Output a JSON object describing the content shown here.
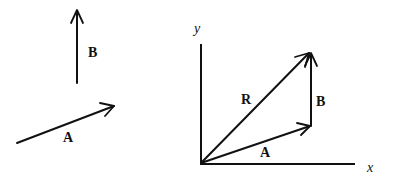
{
  "left_panel": {
    "vectors": [
      {
        "name": "B",
        "label": "B",
        "direction": "up"
      },
      {
        "name": "A",
        "label": "A",
        "direction": "up-right"
      }
    ]
  },
  "right_panel": {
    "axes": {
      "x_label": "x",
      "y_label": "y"
    },
    "vectors": [
      {
        "name": "A",
        "label": "A",
        "from": "origin",
        "to": "tail of B"
      },
      {
        "name": "B",
        "label": "B",
        "from": "head of A",
        "to": "head of R"
      },
      {
        "name": "R",
        "label": "R",
        "from": "origin",
        "to": "head of B",
        "relation": "resultant"
      }
    ]
  }
}
